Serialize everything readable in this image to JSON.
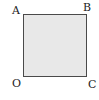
{
  "diagram": {
    "shape": "square",
    "fill_color": "#e8e8e8",
    "stroke_color": "#4a4a4a",
    "vertices": {
      "top_left": "A",
      "top_right": "B",
      "bottom_left": "O",
      "bottom_right": "C"
    }
  }
}
